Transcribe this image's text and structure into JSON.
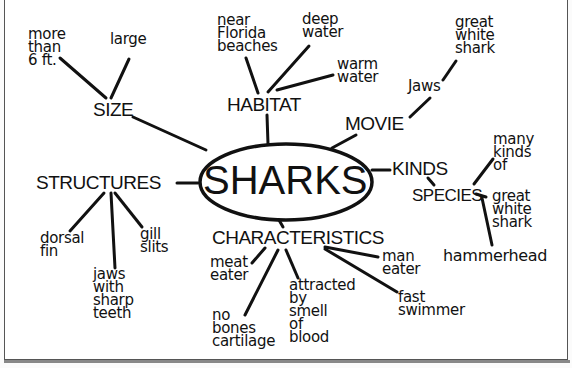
{
  "diagram": {
    "type": "concept-map",
    "center": {
      "label": "SHARKS"
    },
    "branches": [
      {
        "id": "size",
        "label": "SIZE",
        "children": [
          "more\nthan\n6 ft.",
          "large"
        ]
      },
      {
        "id": "habitat",
        "label": "HABITAT",
        "children": [
          "near\nFlorida\nbeaches",
          "deep\nwater",
          "warm\nwater"
        ]
      },
      {
        "id": "movie",
        "label": "MOVIE",
        "children": [
          "Jaws"
        ],
        "grandchildren": [
          "great\nwhite\nshark"
        ]
      },
      {
        "id": "kinds",
        "label": "KINDS",
        "children": [
          "SPECIES"
        ],
        "grandchildren": [
          "many\nkinds\nof",
          "great\nwhite\nshark",
          "hammerhead"
        ]
      },
      {
        "id": "structures",
        "label": "STRUCTURES",
        "children": [
          "dorsal\nfin",
          "jaws\nwith\nsharp\nteeth",
          "gill\nslits"
        ]
      },
      {
        "id": "characteristics",
        "label": "CHARACTERISTICS",
        "children": [
          "meat\neater",
          "no\nbones\ncartilage",
          "attracted\nby\nsmell\nof\nblood",
          "man\neater",
          "fast\nswimmer"
        ]
      }
    ]
  },
  "labels": {
    "center": "SHARKS",
    "size": "SIZE",
    "size_more": "more\nthan\n6 ft.",
    "size_large": "large",
    "habitat": "HABITAT",
    "habitat_florida": "near\nFlorida\nbeaches",
    "habitat_deep": "deep\nwater",
    "habitat_warm": "warm\nwater",
    "movie": "MOVIE",
    "movie_jaws": "Jaws",
    "movie_gws": "great\nwhite\nshark",
    "kinds": "KINDS",
    "species": "SPECIES",
    "species_many": "many\nkinds\nof",
    "species_gws": "great\nwhite\nshark",
    "species_hammer": "hammerhead",
    "structures": "STRUCTURES",
    "struct_dorsal": "dorsal\nfin",
    "struct_jaws": "jaws\nwith\nsharp\nteeth",
    "struct_gill": "gill\nslits",
    "characteristics": "CHARACTERISTICS",
    "char_meat": "meat\neater",
    "char_bones": "no\nbones\ncartilage",
    "char_attracted": "attracted\nby\nsmell\nof\nblood",
    "char_man": "man\neater",
    "char_fast": "fast\nswimmer"
  }
}
